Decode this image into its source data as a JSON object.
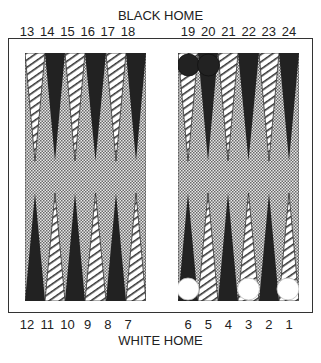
{
  "labels": {
    "top_title": "BLACK HOME",
    "bottom_title": "WHITE HOME"
  },
  "top_points_left": [
    "13",
    "14",
    "15",
    "16",
    "17",
    "18"
  ],
  "top_points_right": [
    "19",
    "20",
    "21",
    "22",
    "23",
    "24"
  ],
  "bottom_points_left": [
    "12",
    "11",
    "10",
    "9",
    "8",
    "7"
  ],
  "bottom_points_right": [
    "6",
    "5",
    "4",
    "3",
    "2",
    "1"
  ],
  "checkers": {
    "black": [
      19,
      20
    ],
    "white": [
      6,
      3,
      1
    ]
  },
  "colors": {
    "dark_point": "#222222",
    "light_point": "#ffffff",
    "board_dots": "#888888",
    "frame": "#333333"
  }
}
